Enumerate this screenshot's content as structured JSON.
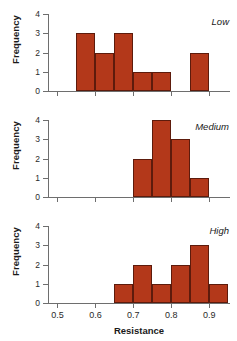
{
  "chart_data": {
    "type": "bar",
    "title": "",
    "xlabel": "Resistance",
    "ylabel": "Frequency",
    "xlim": [
      0.475,
      0.955
    ],
    "ylim": [
      0,
      4
    ],
    "grid": false,
    "bin_width": 0.05,
    "x_ticks": [
      0.5,
      0.6,
      0.7,
      0.8,
      0.9
    ],
    "x_tick_labels": [
      "0.5",
      "0.6",
      "0.7",
      "0.8",
      "0.9"
    ],
    "y_ticks": [
      0,
      1,
      2,
      3,
      4
    ],
    "y_tick_labels": [
      "0",
      "1",
      "2",
      "3",
      "4"
    ],
    "bar_color": "#b3381a",
    "bar_edge_color": "#5d1b0c",
    "axis_color": "#6e6e6e",
    "panels": [
      {
        "label": "Low",
        "bins": [
          {
            "x0": 0.55,
            "x1": 0.6,
            "value": 3
          },
          {
            "x0": 0.6,
            "x1": 0.65,
            "value": 2
          },
          {
            "x0": 0.65,
            "x1": 0.7,
            "value": 3
          },
          {
            "x0": 0.7,
            "x1": 0.75,
            "value": 1
          },
          {
            "x0": 0.75,
            "x1": 0.8,
            "value": 1
          },
          {
            "x0": 0.8,
            "x1": 0.85,
            "value": 0
          },
          {
            "x0": 0.85,
            "x1": 0.9,
            "value": 2
          }
        ]
      },
      {
        "label": "Medium",
        "bins": [
          {
            "x0": 0.7,
            "x1": 0.75,
            "value": 2
          },
          {
            "x0": 0.75,
            "x1": 0.8,
            "value": 4
          },
          {
            "x0": 0.8,
            "x1": 0.85,
            "value": 3
          },
          {
            "x0": 0.85,
            "x1": 0.9,
            "value": 1
          }
        ]
      },
      {
        "label": "High",
        "bins": [
          {
            "x0": 0.65,
            "x1": 0.7,
            "value": 1
          },
          {
            "x0": 0.7,
            "x1": 0.75,
            "value": 2
          },
          {
            "x0": 0.75,
            "x1": 0.8,
            "value": 1
          },
          {
            "x0": 0.8,
            "x1": 0.85,
            "value": 2
          },
          {
            "x0": 0.85,
            "x1": 0.9,
            "value": 3
          },
          {
            "x0": 0.9,
            "x1": 0.95,
            "value": 1
          }
        ]
      }
    ]
  }
}
